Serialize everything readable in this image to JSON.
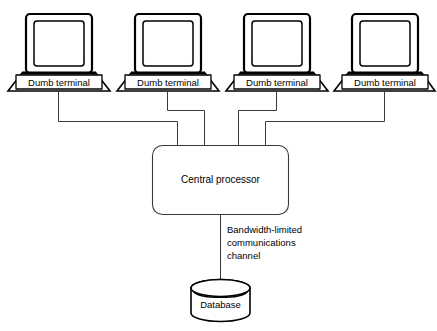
{
  "diagram": {
    "background_color": "#ffffff",
    "line_color": "#3a3a3a",
    "outline_color": "#000000",
    "terminals": [
      {
        "label": "Dumb terminal"
      },
      {
        "label": "Dumb terminal"
      },
      {
        "label": "Dumb terminal"
      },
      {
        "label": "Dumb terminal"
      }
    ],
    "central_processor": {
      "label": "Central processor"
    },
    "channel": {
      "line1": "Bandwidth-limited",
      "line2": "communications",
      "line3": "channel"
    },
    "database": {
      "label": "Database"
    }
  }
}
